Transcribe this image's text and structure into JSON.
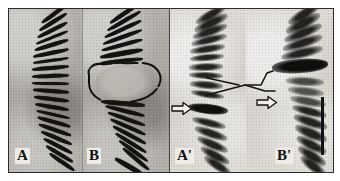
{
  "figure": {
    "panel_count": 4,
    "background_color": "#b9b6b1",
    "border_color": "#2b2b2b",
    "band_color": "#141210"
  },
  "panels": [
    {
      "id": "a",
      "label": "A",
      "style": "stained-banded",
      "background_color": "#aeaba6",
      "description": "Banded chromosome arm with regularly spaced dark transverse bands, curving gently to the right."
    },
    {
      "id": "b",
      "label": "B",
      "style": "stained-banded",
      "background_color": "#aeaba6",
      "description": "Banded chromosome arm interrupted mid-length by a decondensed puff region enclosed by a hand-drawn outline."
    },
    {
      "id": "ap",
      "label": "A'",
      "style": "grainy-labelled",
      "background_color": "#d8d5d0",
      "description": "Corresponding grainy preparation of panel A with a dense labelled band indicated by an arrow."
    },
    {
      "id": "bp",
      "label": "B'",
      "style": "grainy-labelled",
      "background_color": "#d8d5d0",
      "description": "Corresponding grainy preparation of panel B with heavy label over the puff region indicated by an arrow."
    }
  ],
  "annotations": {
    "arrows": [
      {
        "id": "arrow-ap",
        "glyph": "arrow-right-outline",
        "points_to": "A'",
        "target": "labelled band in panel A-prime"
      },
      {
        "id": "arrow-bp",
        "glyph": "arrow-right-outline",
        "points_to": "B'",
        "target": "labelled puff region in panel B-prime"
      }
    ],
    "outline": {
      "id": "puff-outline",
      "panel": "B",
      "shape": "hand-drawn-closed-curve",
      "description": "Hand-drawn outline delimiting the chromosomal puff in panel B"
    },
    "brackets": [
      {
        "id": "bracket-ap",
        "panels": "A' to B'",
        "shape": "angle-bracket",
        "description": "Lines linking the corresponding region between panels A-prime and B-prime"
      }
    ],
    "scale_bar": {
      "id": "scale-bar",
      "orientation": "vertical",
      "position": "right edge of plate",
      "color": "#121212",
      "label": ""
    }
  }
}
